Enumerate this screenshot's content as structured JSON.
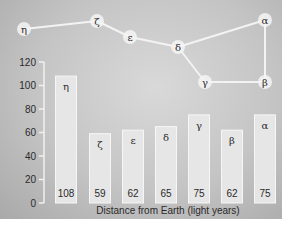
{
  "chart_data": {
    "type": "bar",
    "title": "",
    "xlabel": "Distance from Earth (light years)",
    "ylabel": "",
    "ylim": [
      0,
      120
    ],
    "yticks": [
      0,
      20,
      40,
      60,
      80,
      100,
      120
    ],
    "grid": false,
    "categories": [
      "η",
      "ζ",
      "ε",
      "δ",
      "γ",
      "β",
      "α"
    ],
    "values": [
      108,
      59,
      62,
      65,
      75,
      62,
      75
    ],
    "value_labels": [
      "108",
      "59",
      "62",
      "65",
      "75",
      "62",
      "75"
    ],
    "annotations": "Constellation diagram above bars connects stars η–ζ–ε–δ–γ–β–α (Big Dipper shape)"
  },
  "constellation": {
    "stars": [
      {
        "label": "η",
        "x": 24,
        "y": 29
      },
      {
        "label": "ζ",
        "x": 97,
        "y": 21
      },
      {
        "label": "ε",
        "x": 130,
        "y": 37
      },
      {
        "label": "δ",
        "x": 178,
        "y": 47
      },
      {
        "label": "γ",
        "x": 205,
        "y": 82
      },
      {
        "label": "β",
        "x": 265,
        "y": 82
      },
      {
        "label": "α",
        "x": 265,
        "y": 20
      }
    ],
    "edges": [
      [
        0,
        1
      ],
      [
        1,
        2
      ],
      [
        2,
        3
      ],
      [
        3,
        4
      ],
      [
        4,
        5
      ],
      [
        5,
        6
      ],
      [
        6,
        3
      ]
    ]
  },
  "colors": {
    "bar_fill": "#e6e6e6",
    "bar_stroke": "#f6f6f6",
    "text": "#2a2a2a",
    "line": "#f3f3f3"
  }
}
